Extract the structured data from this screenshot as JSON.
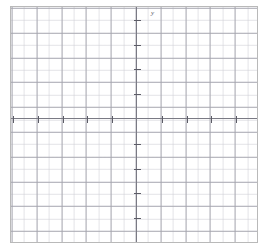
{
  "figure": {
    "kind": "cartesian-grid",
    "background_color": "#ffffff",
    "frame_color": "#b9b9b9",
    "axis_color": "#7a7a84",
    "tick_color": "#5c5c66",
    "major_grid_color": "#a3a3ac",
    "minor_grid_color": "#cdcdd4"
  },
  "axes": {
    "x_axis_label": "x",
    "y_axis_label": "y"
  },
  "chart_data": {
    "type": "scatter",
    "title": "",
    "subtitle": "",
    "xlabel": "x",
    "ylabel": "y",
    "series": [
      {
        "name": "",
        "x": [],
        "y": []
      }
    ],
    "annotations": [],
    "legend": [],
    "legend_position": "none",
    "grid": true,
    "grid_minor": true,
    "xlim": [
      -5,
      5
    ],
    "ylim": [
      -5,
      4.5
    ],
    "x_major_step": 1,
    "y_major_step": 1,
    "x_minor_step": 0.5,
    "y_minor_step": 0.5,
    "x_tick_labels": [],
    "y_tick_labels": [],
    "origin_px": [
      136,
      118
    ],
    "px_per_major_unit": 24.8,
    "note": "Empty Cartesian coordinate grid with no plotted data points or curves"
  },
  "ticks": {
    "x_positive": [
      24.8,
      49.6,
      74.4,
      99.2,
      124.0
    ],
    "x_negative": [
      -24.8,
      -49.6,
      -74.4,
      -99.2,
      -124.0
    ],
    "y_positive": [
      24.8,
      49.6,
      74.4,
      99.2
    ],
    "y_negative": [
      -24.8,
      -49.6,
      -74.4,
      -99.2,
      -124.0
    ]
  }
}
